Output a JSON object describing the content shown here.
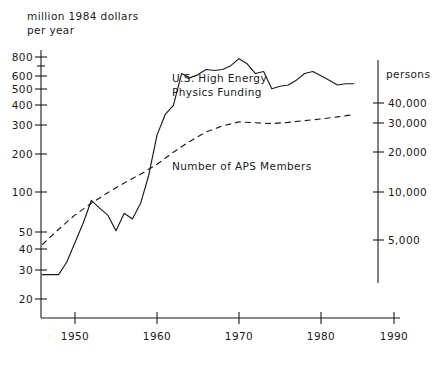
{
  "chart_data": {
    "type": "line",
    "title": "",
    "xlabel": "",
    "ylabel": "million 1984 dollars per year",
    "y2label": "persons",
    "y_axis_title_line1": "million 1984 dollars",
    "y_axis_title_line2": "per year",
    "y2_axis_title": "persons",
    "y_scale": "log",
    "y2_scale": "log",
    "grid": false,
    "legend_position": "inline-annotations",
    "xlim": [
      1946,
      1990
    ],
    "ylim": [
      18,
      900
    ],
    "y2lim": [
      3500,
      52000
    ],
    "x_ticks": [
      1950,
      1960,
      1970,
      1980,
      1990
    ],
    "x_tick_labels": [
      "1950",
      "1960",
      "1970",
      "1980",
      "1990"
    ],
    "y_ticks": [
      20,
      30,
      40,
      50,
      100,
      200,
      300,
      400,
      500,
      600,
      800
    ],
    "y_tick_labels": [
      "20",
      "30",
      "40",
      "50",
      "100",
      "200",
      "300",
      "400",
      "500",
      "600",
      "800"
    ],
    "y2_ticks": [
      5000,
      10000,
      20000,
      30000,
      40000
    ],
    "y2_tick_labels": [
      "5,000",
      "10,000",
      "20,000",
      "30,000",
      "40,000"
    ],
    "annotations": [
      {
        "text": "U.S. High Energy",
        "x": 1963.5,
        "y": 430
      },
      {
        "text": "Physics Funding",
        "x": 1963.5,
        "y": 350
      },
      {
        "text": "Number of APS Members",
        "x": 1964.0,
        "y": 118
      }
    ],
    "series": [
      {
        "name": "U.S. High Energy Physics Funding",
        "style": "solid",
        "axis": "left",
        "units": "million 1984 dollars per year",
        "x": [
          1946,
          1947,
          1948,
          1949,
          1950,
          1951,
          1952,
          1953,
          1954,
          1955,
          1956,
          1957,
          1958,
          1959,
          1960,
          1961,
          1962,
          1963,
          1964,
          1965,
          1966,
          1967,
          1968,
          1969,
          1970,
          1971,
          1972,
          1973,
          1974,
          1975,
          1976,
          1977,
          1978,
          1979,
          1980,
          1981,
          1982,
          1983,
          1984
        ],
        "values": [
          28,
          28,
          28,
          34,
          46,
          62,
          88,
          78,
          70,
          55,
          72,
          66,
          84,
          130,
          240,
          330,
          380,
          620,
          580,
          610,
          660,
          650,
          660,
          700,
          780,
          720,
          620,
          640,
          490,
          510,
          520,
          560,
          620,
          640,
          600,
          560,
          520,
          530,
          530
        ]
      },
      {
        "name": "Number of APS Members",
        "style": "dashed",
        "axis": "right",
        "units": "persons",
        "x": [
          1946,
          1948,
          1950,
          1952,
          1954,
          1956,
          1958,
          1960,
          1962,
          1964,
          1966,
          1968,
          1970,
          1972,
          1974,
          1976,
          1978,
          1980,
          1982,
          1984
        ],
        "values": [
          4400,
          5600,
          7000,
          8400,
          9900,
          11500,
          13200,
          15400,
          18600,
          22000,
          25500,
          28000,
          29800,
          29400,
          29000,
          29600,
          30400,
          31200,
          32200,
          33400
        ]
      }
    ]
  },
  "axis": {
    "left_title_line1": "million 1984 dollars",
    "left_title_line2": "per year",
    "right_title": "persons"
  }
}
